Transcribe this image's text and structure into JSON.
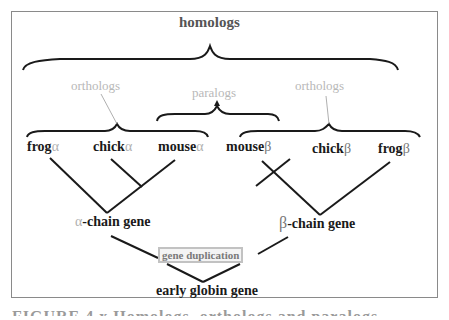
{
  "diagram": {
    "title": "homologs",
    "groups": {
      "orthologs_left": "orthologs",
      "paralogs": "paralogs",
      "orthologs_right": "orthologs"
    },
    "leaves": [
      {
        "name": "frog",
        "greek": "α"
      },
      {
        "name": "chick",
        "greek": "α"
      },
      {
        "name": "mouse",
        "greek": "α"
      },
      {
        "name": "mouse",
        "greek": "β"
      },
      {
        "name": "chick",
        "greek": "β"
      },
      {
        "name": "frog",
        "greek": "β"
      }
    ],
    "internal_nodes": {
      "alpha_gene": {
        "greek": "α",
        "label": "-chain gene"
      },
      "beta_gene": {
        "greek": "β",
        "label": "-chain gene"
      },
      "event": "gene duplication",
      "root": "early globin gene"
    },
    "colors": {
      "line": "#1a1a1a",
      "faint_label": "#b8b8b8",
      "border": "#8a8a8a"
    }
  },
  "caption": "FIGURE 4.x  Homologs, orthologs and paralogs"
}
